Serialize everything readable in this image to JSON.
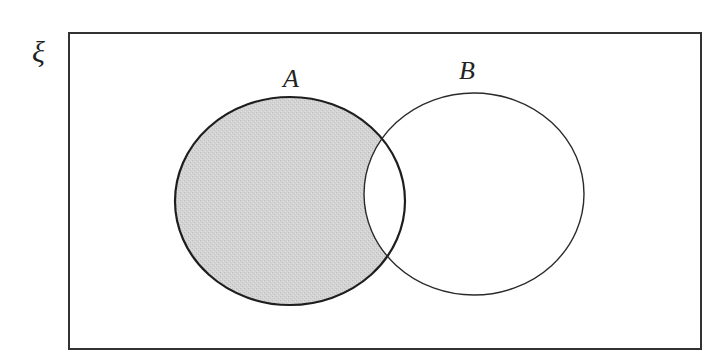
{
  "diagram": {
    "type": "venn",
    "universal_set": {
      "label": "ξ",
      "rect": {
        "x": 69,
        "y": 33,
        "width": 632,
        "height": 316
      },
      "stroke": "#333333"
    },
    "sets": [
      {
        "name": "A",
        "label": "A",
        "ellipse": {
          "cx": 290,
          "cy": 201,
          "rx": 115,
          "ry": 104
        },
        "label_pos": {
          "x": 291,
          "y": 87
        },
        "stroke": "#1e1e1e",
        "stroke_width": 2.2
      },
      {
        "name": "B",
        "label": "B",
        "ellipse": {
          "cx": 474,
          "cy": 194,
          "rx": 110,
          "ry": 101
        },
        "label_pos": {
          "x": 467,
          "y": 79
        },
        "stroke": "#2a2a2a",
        "stroke_width": 1.4
      }
    ],
    "shaded_region": "A only (A ∩ B')",
    "shade_color": "#cfcfcf",
    "background": "#ffffff"
  }
}
